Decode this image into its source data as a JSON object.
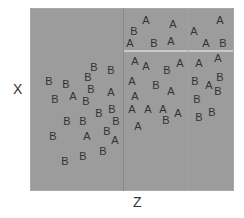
{
  "chart_data": {
    "type": "scatter",
    "title": "",
    "xlabel": "Z",
    "ylabel": "X",
    "grid": false,
    "legend": null,
    "splits": [
      {
        "orientation": "vertical",
        "position_px": 123,
        "from_y_px": 8,
        "to_y_px": 191
      },
      {
        "orientation": "horizontal",
        "position_px": 50,
        "from_x_px": 124,
        "to_x_px": 233
      },
      {
        "orientation": "vertical",
        "position_px": 188,
        "from_y_px": 8,
        "to_y_px": 191,
        "faint": true
      }
    ],
    "points": [
      {
        "label": "A",
        "x": 146,
        "y": 20
      },
      {
        "label": "B",
        "x": 134,
        "y": 31
      },
      {
        "label": "A",
        "x": 173,
        "y": 24
      },
      {
        "label": "A",
        "x": 220,
        "y": 20
      },
      {
        "label": "A",
        "x": 194,
        "y": 31
      },
      {
        "label": "A",
        "x": 130,
        "y": 43
      },
      {
        "label": "B",
        "x": 154,
        "y": 43
      },
      {
        "label": "A",
        "x": 171,
        "y": 41
      },
      {
        "label": "A",
        "x": 206,
        "y": 43
      },
      {
        "label": "B",
        "x": 223,
        "y": 43
      },
      {
        "label": "A",
        "x": 135,
        "y": 61
      },
      {
        "label": "A",
        "x": 146,
        "y": 66
      },
      {
        "label": "B",
        "x": 167,
        "y": 70
      },
      {
        "label": "A",
        "x": 180,
        "y": 63
      },
      {
        "label": "A",
        "x": 199,
        "y": 63
      },
      {
        "label": "A",
        "x": 218,
        "y": 58
      },
      {
        "label": "A",
        "x": 132,
        "y": 81
      },
      {
        "label": "B",
        "x": 156,
        "y": 85
      },
      {
        "label": "A",
        "x": 171,
        "y": 91
      },
      {
        "label": "B",
        "x": 195,
        "y": 81
      },
      {
        "label": "B",
        "x": 220,
        "y": 77
      },
      {
        "label": "A",
        "x": 209,
        "y": 85
      },
      {
        "label": "B",
        "x": 218,
        "y": 91
      },
      {
        "label": "A",
        "x": 135,
        "y": 96
      },
      {
        "label": "B",
        "x": 197,
        "y": 99
      },
      {
        "label": "A",
        "x": 132,
        "y": 109
      },
      {
        "label": "A",
        "x": 148,
        "y": 109
      },
      {
        "label": "A",
        "x": 163,
        "y": 109
      },
      {
        "label": "A",
        "x": 178,
        "y": 113
      },
      {
        "label": "B",
        "x": 166,
        "y": 120
      },
      {
        "label": "B",
        "x": 199,
        "y": 117
      },
      {
        "label": "B",
        "x": 212,
        "y": 112
      },
      {
        "label": "A",
        "x": 138,
        "y": 126
      },
      {
        "label": "B",
        "x": 94,
        "y": 67
      },
      {
        "label": "B",
        "x": 111,
        "y": 70
      },
      {
        "label": "B",
        "x": 88,
        "y": 77
      },
      {
        "label": "B",
        "x": 49,
        "y": 81
      },
      {
        "label": "B",
        "x": 66,
        "y": 84
      },
      {
        "label": "B",
        "x": 91,
        "y": 89
      },
      {
        "label": "A",
        "x": 111,
        "y": 92
      },
      {
        "label": "B",
        "x": 55,
        "y": 99
      },
      {
        "label": "A",
        "x": 73,
        "y": 96
      },
      {
        "label": "B",
        "x": 86,
        "y": 101
      },
      {
        "label": "B",
        "x": 99,
        "y": 113
      },
      {
        "label": "B",
        "x": 112,
        "y": 109
      },
      {
        "label": "B",
        "x": 116,
        "y": 121
      },
      {
        "label": "B",
        "x": 67,
        "y": 121
      },
      {
        "label": "B",
        "x": 83,
        "y": 121
      },
      {
        "label": "B",
        "x": 53,
        "y": 136
      },
      {
        "label": "A",
        "x": 87,
        "y": 136
      },
      {
        "label": "B",
        "x": 107,
        "y": 131
      },
      {
        "label": "A",
        "x": 115,
        "y": 140
      },
      {
        "label": "B",
        "x": 103,
        "y": 151
      },
      {
        "label": "B",
        "x": 83,
        "y": 156
      },
      {
        "label": "B",
        "x": 65,
        "y": 161
      }
    ],
    "colors": {
      "plot_background": "#9c9c9c",
      "split_vertical": "#8a8a8a",
      "split_horizontal": "#c9c9c9",
      "glyph": "#333333"
    }
  }
}
